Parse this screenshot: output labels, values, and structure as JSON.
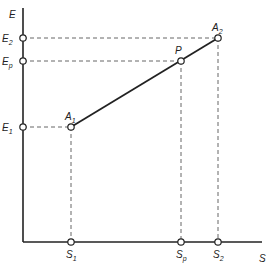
{
  "axes": {
    "y_label": "E",
    "x_label": "S",
    "origin": [
      23,
      242
    ],
    "y_top": 8,
    "x_right": 262
  },
  "points": [
    {
      "id": "A1",
      "name": "A",
      "sub": "1",
      "x": 71,
      "y": 127
    },
    {
      "id": "P",
      "name": "P",
      "sub": "",
      "x": 181,
      "y": 61
    },
    {
      "id": "A2",
      "name": "A",
      "sub": "2",
      "x": 218,
      "y": 38
    }
  ],
  "y_ticks": [
    {
      "name": "E",
      "sub": "2",
      "y": 38
    },
    {
      "name": "E",
      "sub": "p",
      "y": 61
    },
    {
      "name": "E",
      "sub": "1",
      "y": 127
    }
  ],
  "x_ticks": [
    {
      "name": "S",
      "sub": "1",
      "x": 71
    },
    {
      "name": "S",
      "sub": "p",
      "x": 181
    },
    {
      "name": "S",
      "sub": "2",
      "x": 218
    }
  ],
  "colors": {
    "line": "#222222",
    "dash": "#555555"
  }
}
